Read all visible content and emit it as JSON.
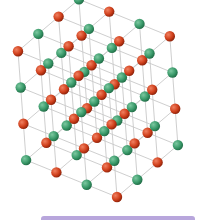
{
  "image": {
    "subject": "crystal lattice model",
    "lattice_size": [
      4,
      4,
      4
    ],
    "colors": {
      "background": "#ffffff",
      "atom_a": "#d0401c",
      "atom_a_highlight": "#f08060",
      "atom_b": "#3a9a6a",
      "atom_b_highlight": "#7cc8a0",
      "bond": "#c8c8c8",
      "bar": "#b8a6dc"
    },
    "projection": {
      "origin": [
        117,
        197
      ],
      "x_step": [
        -30.3,
        -12.3
      ],
      "y_step": [
        20.3,
        -17.3
      ],
      "z_step": [
        -2.7,
        -36.3
      ]
    },
    "atom_radius": 5.2
  }
}
